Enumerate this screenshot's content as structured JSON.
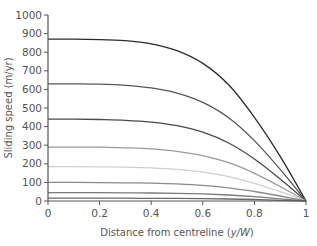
{
  "chart_data": {
    "type": "line",
    "title": "",
    "xlabel": "Distance from centreline (y/W)",
    "xlabel_plain": "Distance from centreline (",
    "xlabel_italic": "y/W",
    "xlabel_close": ")",
    "ylabel": "Sliding speed (m/yr)",
    "xlim": [
      0,
      1
    ],
    "ylim": [
      0,
      1000
    ],
    "x_ticks": [
      0,
      0.2,
      0.4,
      0.6,
      0.8,
      1
    ],
    "x_tick_labels": [
      "0",
      "0.2",
      "0.4",
      "0.6",
      "0.8",
      "1"
    ],
    "y_ticks": [
      0,
      100,
      200,
      300,
      400,
      500,
      600,
      700,
      800,
      900,
      1000
    ],
    "y_tick_labels": [
      "0",
      "100",
      "200",
      "300",
      "400",
      "500",
      "600",
      "700",
      "800",
      "900",
      "1000"
    ],
    "grid": false,
    "legend": null,
    "x": [
      0,
      0.1,
      0.2,
      0.3,
      0.4,
      0.5,
      0.6,
      0.7,
      0.8,
      0.9,
      1.0
    ],
    "series": [
      {
        "name": "curve-1",
        "color": "#2b2b2b",
        "values": [
          870,
          870,
          868,
          862,
          845,
          808,
          740,
          625,
          450,
          240,
          0
        ]
      },
      {
        "name": "curve-2",
        "color": "#555555",
        "values": [
          630,
          630,
          628,
          622,
          608,
          580,
          530,
          448,
          325,
          170,
          0
        ]
      },
      {
        "name": "curve-3",
        "color": "#4a4a4a",
        "values": [
          440,
          440,
          438,
          434,
          424,
          405,
          370,
          312,
          226,
          118,
          0
        ]
      },
      {
        "name": "curve-4",
        "color": "#9a9a9a",
        "values": [
          290,
          290,
          289,
          286,
          280,
          267,
          244,
          206,
          149,
          78,
          0
        ]
      },
      {
        "name": "curve-5",
        "color": "#cfcfcf",
        "values": [
          185,
          185,
          184,
          182,
          178,
          170,
          155,
          131,
          95,
          50,
          0
        ]
      },
      {
        "name": "curve-6",
        "color": "#8a8a8a",
        "values": [
          100,
          100,
          99,
          98,
          96,
          92,
          84,
          71,
          51,
          27,
          0
        ]
      },
      {
        "name": "curve-7",
        "color": "#7a7a7a",
        "values": [
          45,
          45,
          45,
          44,
          43,
          41,
          38,
          32,
          23,
          12,
          0
        ]
      },
      {
        "name": "curve-8",
        "color": "#6a6a6a",
        "values": [
          15,
          15,
          15,
          15,
          14,
          14,
          13,
          11,
          8,
          4,
          0
        ]
      }
    ]
  }
}
